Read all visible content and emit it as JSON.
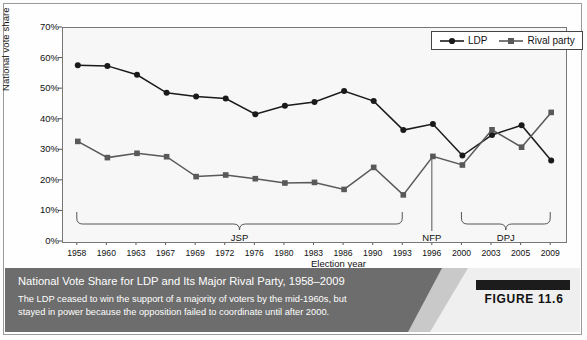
{
  "figure": {
    "label": "FIGURE 11.6",
    "caption_title": "National Vote Share for LDP and Its Major Rival Party, 1958–2009",
    "caption_body_line1": "The LDP ceased to win the support of a majority of voters by the mid-1960s, but",
    "caption_body_line2": "stayed in power because the opposition failed to coordinate until after 2000."
  },
  "legend": {
    "items": [
      {
        "label": "LDP",
        "marker": "circle-marker-icon",
        "color": "#1a1a1a"
      },
      {
        "label": "Rival party",
        "marker": "square-marker-icon",
        "color": "#595959"
      }
    ]
  },
  "annotations": {
    "brackets": [
      {
        "label": "JSP",
        "start_year": "1958",
        "end_year": "1993"
      },
      {
        "label": "DPJ",
        "start_year": "2000",
        "end_year": "2009"
      }
    ],
    "markers": [
      {
        "label": "NFP",
        "year": "1996"
      }
    ]
  },
  "chart_data": {
    "type": "line",
    "title": "National Vote Share for LDP and Its Major Rival Party, 1958–2009",
    "xlabel": "Election year",
    "ylabel": "National vote share",
    "grid": false,
    "legend_position": "top-right",
    "ylim": [
      0,
      70
    ],
    "ytick_labels": [
      "0%",
      "10%",
      "20%",
      "30%",
      "40%",
      "50%",
      "60%",
      "70%"
    ],
    "ytick_values": [
      0,
      10,
      20,
      30,
      40,
      50,
      60,
      70
    ],
    "categories": [
      "1958",
      "1960",
      "1963",
      "1967",
      "1969",
      "1972",
      "1976",
      "1980",
      "1983",
      "1986",
      "1990",
      "1993",
      "1996",
      "2000",
      "2003",
      "2005",
      "2009"
    ],
    "series": [
      {
        "name": "LDP",
        "marker": "circle",
        "color": "#1a1a1a",
        "values": [
          57.8,
          57.6,
          54.7,
          48.8,
          47.6,
          46.9,
          41.8,
          44.6,
          45.8,
          49.4,
          46.1,
          36.6,
          38.6,
          28.3,
          35.0,
          38.2,
          26.7
        ]
      },
      {
        "name": "Rival party",
        "marker": "square",
        "color": "#595959",
        "values": [
          32.9,
          27.6,
          29.0,
          27.9,
          21.4,
          21.9,
          20.7,
          19.3,
          19.5,
          17.2,
          24.4,
          15.4,
          28.0,
          25.2,
          36.7,
          31.0,
          42.4
        ]
      }
    ]
  }
}
